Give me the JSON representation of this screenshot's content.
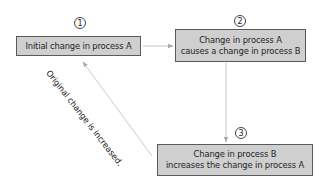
{
  "diagram": {
    "type": "positive-feedback-loop",
    "steps": [
      {
        "number": "1",
        "lines": [
          "Initial change in process A"
        ]
      },
      {
        "number": "2",
        "lines": [
          "Change in process A",
          "causes a change in process B"
        ]
      },
      {
        "number": "3",
        "lines": [
          "Change in process B",
          "increases the change in process A"
        ]
      }
    ],
    "edges": [
      {
        "from": "1",
        "to": "2",
        "label": ""
      },
      {
        "from": "2",
        "to": "3",
        "label": ""
      },
      {
        "from": "3",
        "to": "1",
        "label": "Original change is increased."
      }
    ],
    "colors": {
      "box_fill": "#cfcfcf",
      "box_border": "#5a5a5a",
      "arrow": "#b8b8b8",
      "text": "#1e1e1e"
    }
  }
}
